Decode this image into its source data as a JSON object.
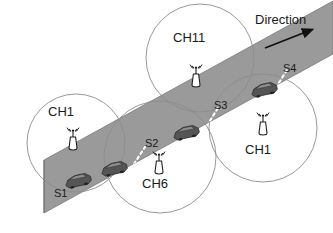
{
  "figure": {
    "type": "vehicular-network-diagram",
    "title_text": "",
    "background_color": "#ffffff",
    "road_color": "#9a9a9a",
    "road_edge_color": "#6e6e6e",
    "circle_stroke_color": "#8c8c8c",
    "divider_color": "#ffffff",
    "car_color": "#4a4a4a",
    "text_color": "#1a1a1a"
  },
  "direction": {
    "label": "Direction",
    "arrow_icon": "arrow-up-right-icon"
  },
  "channels": [
    {
      "id": "ch1-left",
      "label": "CH1",
      "cx": 76,
      "cy": 143,
      "r": 49,
      "ant_x": 73,
      "ant_y": 148,
      "lbl_x": 48,
      "lbl_y": 110
    },
    {
      "id": "ch6",
      "label": "CH6",
      "cx": 160,
      "cy": 157,
      "r": 56,
      "ant_x": 159,
      "ant_y": 172,
      "lbl_x": 144,
      "lbl_y": 182
    },
    {
      "id": "ch11",
      "label": "CH11",
      "cx": 200,
      "cy": 58,
      "r": 54,
      "ant_x": 196,
      "ant_y": 85,
      "lbl_x": 176,
      "lbl_y": 37
    },
    {
      "id": "ch1-right",
      "label": "CH1",
      "cx": 263,
      "cy": 128,
      "r": 54,
      "ant_x": 263,
      "ant_y": 133,
      "lbl_x": 246,
      "lbl_y": 148
    }
  ],
  "segments": [
    {
      "id": "s1",
      "label": "S1",
      "x": 58,
      "y": 186
    },
    {
      "id": "s2",
      "label": "S2",
      "x": 148,
      "y": 137
    },
    {
      "id": "s3",
      "label": "S3",
      "x": 216,
      "y": 100
    },
    {
      "id": "s4",
      "label": "S4",
      "x": 283,
      "y": 68
    }
  ],
  "vehicles": [
    {
      "id": "car-1",
      "x": 78,
      "y": 180,
      "segment": "S1"
    },
    {
      "id": "car-2",
      "x": 112,
      "y": 170,
      "segment": "S1"
    },
    {
      "id": "car-3",
      "x": 185,
      "y": 132,
      "segment": "S2"
    },
    {
      "id": "car-4",
      "x": 263,
      "y": 89,
      "segment": "S3"
    }
  ],
  "dividers": [
    {
      "id": "divider-s1-s2",
      "x1": 123,
      "y1": 181,
      "x2": 143,
      "y2": 150
    },
    {
      "id": "divider-s2-s3",
      "x1": 196,
      "y1": 143,
      "x2": 216,
      "y2": 111
    },
    {
      "id": "divider-s3-s4",
      "x1": 265,
      "y1": 105,
      "x2": 285,
      "y2": 73
    }
  ]
}
